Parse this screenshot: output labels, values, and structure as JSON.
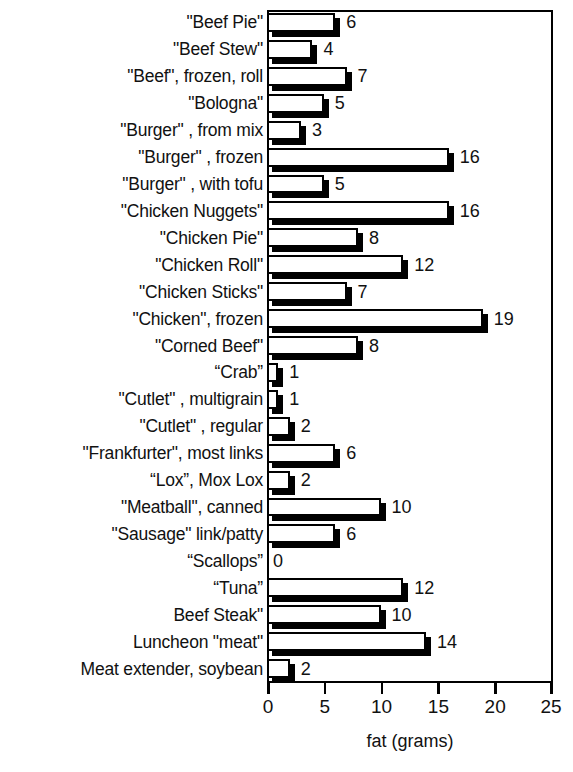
{
  "chart_data": {
    "type": "bar",
    "orientation": "horizontal",
    "title": "",
    "xlabel": "fat (grams)",
    "ylabel": "",
    "xlim": [
      0,
      25
    ],
    "xticks": [
      0,
      5,
      10,
      15,
      20,
      25
    ],
    "xtick_labels": [
      "0",
      "5",
      "10",
      "15",
      "20",
      "25"
    ],
    "grid": false,
    "legend": null,
    "bar_style": "white-fill-black-outline-with-drop-shadow",
    "value_labels": true,
    "categories": [
      "\"Beef Pie\"",
      "\"Beef Stew\"",
      "\"Beef\", frozen, roll",
      "\"Bologna\"",
      "\"Burger\" , from mix",
      "\"Burger\" , frozen",
      "\"Burger\" , with tofu",
      "\"Chicken Nuggets\"",
      "\"Chicken Pie\"",
      "\"Chicken Roll\"",
      "\"Chicken Sticks\"",
      "\"Chicken\", frozen",
      "\"Corned Beef\"",
      "“Crab”",
      "\"Cutlet\" , multigrain",
      "\"Cutlet\" , regular",
      "\"Frankfurter\", most links",
      "“Lox”, Mox Lox",
      "\"Meatball\", canned",
      "\"Sausage\" link/patty",
      "“Scallops”",
      "“Tuna”",
      "Beef Steak\"",
      "Luncheon \"meat\"",
      "Meat extender, soybean"
    ],
    "values": [
      6,
      4,
      7,
      5,
      3,
      16,
      5,
      16,
      8,
      12,
      7,
      19,
      8,
      1,
      1,
      2,
      6,
      2,
      10,
      6,
      0,
      12,
      10,
      14,
      2
    ],
    "value_label_text": [
      "6",
      "4",
      "7",
      "5",
      "3",
      "16",
      "5",
      "16",
      "8",
      "12",
      "7",
      "19",
      "8",
      "1",
      "1",
      "2",
      "6",
      "2",
      "10",
      "6",
      "0",
      "12",
      "10",
      "14",
      "2"
    ]
  },
  "colors": {
    "bar_fill": "#ffffff",
    "bar_outline": "#000000",
    "bar_shadow": "#000000",
    "axis": "#000000",
    "text": "#111111",
    "background": "#ffffff"
  }
}
